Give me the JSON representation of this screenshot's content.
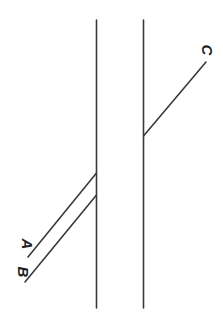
{
  "canvas": {
    "width": 223,
    "height": 319,
    "background": "#ffffff"
  },
  "style": {
    "stroke_color": "#3a3a3a",
    "stroke_width": 1.6,
    "label_color": "#1e1e1e",
    "label_font_size": 15
  },
  "diagram": {
    "type": "line-diagram",
    "vertical_lines": [
      {
        "id": "left-vertical-line",
        "name": "left-vertical-line",
        "x1": 96.5,
        "y1": 20,
        "x2": 96.5,
        "y2": 308
      },
      {
        "id": "right-vertical-line",
        "name": "right-vertical-line",
        "x1": 143.5,
        "y1": 20,
        "x2": 143.5,
        "y2": 308
      }
    ],
    "rays": [
      {
        "id": "ray-a",
        "label": "A",
        "x1": 28,
        "y1": 257,
        "x2": 96.5,
        "y2": 173,
        "label_x": 22,
        "label_y": 244,
        "label_rotation": 90
      },
      {
        "id": "ray-b",
        "label": "B",
        "x1": 25,
        "y1": 282,
        "x2": 96.5,
        "y2": 195,
        "label_x": 18,
        "label_y": 272,
        "label_rotation": 90
      },
      {
        "id": "ray-c",
        "label": "C",
        "x1": 143.5,
        "y1": 136,
        "x2": 206,
        "y2": 62,
        "label_x": 202,
        "label_y": 50,
        "label_rotation": 90
      }
    ]
  }
}
